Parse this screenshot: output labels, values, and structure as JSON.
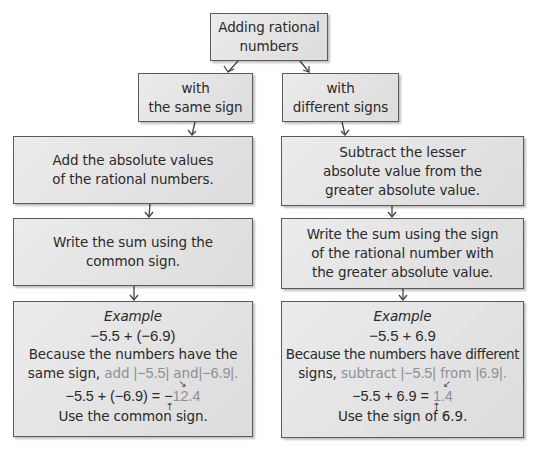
{
  "top": {
    "lines": [
      "Adding rational",
      "numbers"
    ]
  },
  "left": {
    "branch": [
      "with",
      "the same sign"
    ],
    "step1": [
      "Add the absolute values",
      "of the rational numbers."
    ],
    "step2": [
      "Write the sum using the",
      "common sign."
    ],
    "example": {
      "title": "Example",
      "expression": "−5.5 + (−6.9)",
      "explain_line1": "Because the numbers have the",
      "explain_line2_prefix": "same sign,",
      "explain_line2_highlight_1": "add",
      "abs_a": "|−5.5|",
      "explain_line2_highlight_2": "and",
      "abs_b": "|−6.9|",
      "period": ".",
      "result_lhs": "−5.5 + (−6.9) =",
      "result_sign": "−",
      "result_value": "12.4",
      "note": "Use the common sign."
    }
  },
  "right": {
    "branch": [
      "with",
      "different signs"
    ],
    "step1": [
      "Subtract the lesser",
      "absolute value from the",
      "greater absolute value."
    ],
    "step2": [
      "Write the sum using the sign",
      "of the rational number with",
      "the greater absolute value."
    ],
    "example": {
      "title": "Example",
      "expression": "−5.5 + 6.9",
      "explain_line1": "Because the numbers have different",
      "explain_line2_prefix": "signs,",
      "explain_line2_highlight_1": "subtract",
      "abs_a": "|−5.5|",
      "explain_line2_highlight_2": "from",
      "abs_b": "|6.9|",
      "period": ".",
      "result_lhs": "−5.5 + 6.9 =",
      "result_value": "1.4",
      "note": "Use the sign of 6.9."
    }
  },
  "colors": {
    "box_fill": "#e4e4e4",
    "box_border": "#5a5a5a",
    "text": "#2a2a2a",
    "highlight": "#8c9097"
  }
}
